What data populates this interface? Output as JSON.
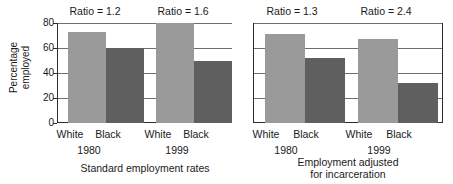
{
  "chart_data": {
    "type": "bar",
    "title": "",
    "ylabel": "Percentage employed",
    "ylabel_lines": [
      "Percentage",
      "employed"
    ],
    "xlabel": "",
    "ylim": [
      0,
      80
    ],
    "yticks": [
      80,
      60,
      40,
      20,
      0
    ],
    "ytick_labels": [
      "80",
      "60",
      "40",
      "20",
      "0"
    ],
    "grid": "horizontal",
    "legend": "none",
    "categories": [
      "White",
      "Black"
    ],
    "group_labels": [
      "1980",
      "1999"
    ],
    "panels": [
      {
        "caption": "Standard employment rates",
        "caption_lines": [
          "Standard employment rates"
        ],
        "groups": [
          {
            "year": "1980",
            "annotation": "Ratio = 1.2",
            "ratio": 1.2,
            "bars": [
              {
                "category": "White",
                "value": 73
              },
              {
                "category": "Black",
                "value": 60
              }
            ]
          },
          {
            "year": "1999",
            "annotation": "Ratio = 1.6",
            "ratio": 1.6,
            "bars": [
              {
                "category": "White",
                "value": 80
              },
              {
                "category": "Black",
                "value": 50
              }
            ]
          }
        ]
      },
      {
        "caption": "Employment adjusted for incarceration",
        "caption_lines": [
          "Employment adjusted",
          "for incarceration"
        ],
        "groups": [
          {
            "year": "1980",
            "annotation": "Ratio = 1.3",
            "ratio": 1.3,
            "bars": [
              {
                "category": "White",
                "value": 71
              },
              {
                "category": "Black",
                "value": 52
              }
            ]
          },
          {
            "year": "1999",
            "annotation": "Ratio = 2.4",
            "ratio": 2.4,
            "bars": [
              {
                "category": "White",
                "value": 67
              },
              {
                "category": "Black",
                "value": 32
              }
            ]
          }
        ]
      }
    ],
    "colors": {
      "white_category_bar": "#9a9a9a",
      "black_category_bar": "#5f5f5f",
      "axis": "#2b2b2b",
      "gridline": "#6e6e6e",
      "text": "#1a1a1a",
      "background": "#ffffff"
    }
  }
}
